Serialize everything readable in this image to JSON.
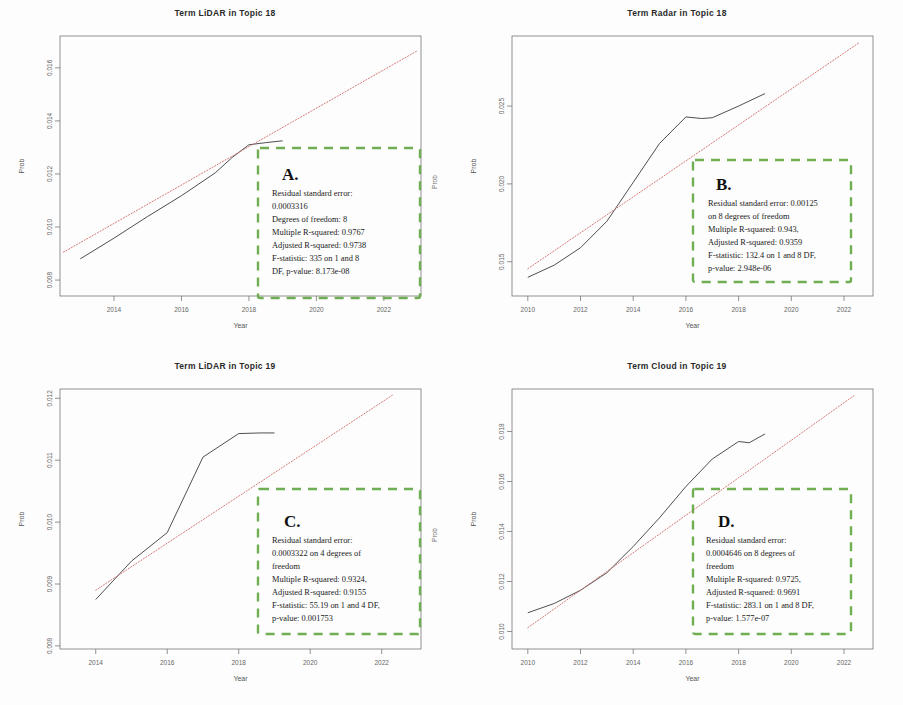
{
  "figure": {
    "panel_count": 4,
    "axis_label_x": "Year",
    "axis_label_y": "Prob",
    "annotation_box_color": "#6fae52",
    "fit_line_color": "#d06a6a",
    "data_line_color": "#3b3b3b"
  },
  "chart_data": [
    {
      "id": "A",
      "type": "line",
      "title": "Term LiDAR in Topic 18",
      "xlabel": "Year",
      "ylabel": "Prob",
      "xlim": [
        2012.4,
        2023.1
      ],
      "ylim": [
        0.0074,
        0.0172
      ],
      "xticks": [
        2014,
        2016,
        2018,
        2020,
        2022
      ],
      "yticks": [
        0.008,
        0.01,
        0.012,
        0.014,
        0.016
      ],
      "ytick_labels": [
        "0.008",
        "0.010",
        "0.012",
        "0.014",
        "0.016"
      ],
      "grid": false,
      "legend": "none",
      "series": [
        {
          "name": "observed",
          "style": "solid",
          "x": [
            2013,
            2014,
            2015,
            2016,
            2017,
            2017.5,
            2018,
            2018.5,
            2019
          ],
          "values": [
            0.0088,
            0.00958,
            0.0104,
            0.01118,
            0.01204,
            0.01262,
            0.0131,
            0.01318,
            0.01325
          ]
        },
        {
          "name": "linear fit",
          "style": "dotted",
          "x": [
            2012.5,
            2023.0
          ],
          "values": [
            0.00905,
            0.01665
          ]
        }
      ],
      "annotation": {
        "letter": "A.",
        "lines": [
          "Residual standard error:",
          "0.0003316",
          "Degrees of freedom: 8",
          "Multiple R-squared:  0.9767",
          "Adjusted R-squared:  0.9738",
          "F-statistic:    335  on 1  and 8",
          "DF, p-value: 8.173e-08"
        ]
      }
    },
    {
      "id": "B",
      "type": "line",
      "title": "Term Radar in Topic 18",
      "xlabel": "Year",
      "ylabel": "Prob",
      "xlim": [
        2009.4,
        2023.1
      ],
      "ylim": [
        0.0128,
        0.0295
      ],
      "xticks": [
        2010,
        2012,
        2014,
        2016,
        2018,
        2020,
        2022
      ],
      "yticks": [
        0.015,
        0.02,
        0.025
      ],
      "ytick_labels": [
        "0.015",
        "0.020",
        "0.025"
      ],
      "grid": false,
      "legend": "none",
      "series": [
        {
          "name": "observed",
          "style": "solid",
          "x": [
            2010,
            2011,
            2012,
            2013,
            2014,
            2015,
            2016,
            2016.6,
            2017,
            2018,
            2019
          ],
          "values": [
            0.014,
            0.01478,
            0.0159,
            0.0176,
            0.0201,
            0.0226,
            0.0243,
            0.0242,
            0.02425,
            0.025,
            0.0258
          ]
        },
        {
          "name": "linear fit",
          "style": "dotted",
          "x": [
            2010.0,
            2022.6
          ],
          "values": [
            0.01455,
            0.0291
          ]
        }
      ],
      "annotation": {
        "letter": "B.",
        "lines": [
          "Residual standard error: 0.00125",
          "on 8 degrees of freedom",
          "Multiple R-squared:  0.943,",
          "Adjusted R-squared:  0.9359",
          "F-statistic: 132.4 on 1 and 8 DF,",
          "p-value: 2.948e-06"
        ]
      }
    },
    {
      "id": "C",
      "type": "line",
      "title": "Term LiDAR in Topic 19",
      "xlabel": "Year",
      "ylabel": "Prob",
      "xlim": [
        2013.0,
        2023.1
      ],
      "ylim": [
        0.00795,
        0.01215
      ],
      "xticks": [
        2014,
        2016,
        2018,
        2020,
        2022
      ],
      "yticks": [
        0.008,
        0.009,
        0.01,
        0.011,
        0.012
      ],
      "ytick_labels": [
        "0.008",
        "0.009",
        "0.010",
        "0.011",
        "0.012"
      ],
      "grid": false,
      "legend": "none",
      "series": [
        {
          "name": "observed",
          "style": "solid",
          "x": [
            2014,
            2015,
            2016,
            2017,
            2018,
            2018.6,
            2019
          ],
          "values": [
            0.00875,
            0.00937,
            0.00983,
            0.01105,
            0.01143,
            0.01144,
            0.01144
          ]
        },
        {
          "name": "linear fit",
          "style": "dotted",
          "x": [
            2014.0,
            2022.3
          ],
          "values": [
            0.0089,
            0.01205
          ]
        }
      ],
      "annotation": {
        "letter": "C.",
        "lines": [
          "Residual standard error:",
          "0.0003322 on 4 degrees of",
          "freedom",
          "Multiple R-squared:  0.9324,",
          "Adjusted R-squared:  0.9155",
          "F-statistic: 55.19 on 1 and 4 DF,",
          "p-value: 0.001753"
        ]
      }
    },
    {
      "id": "D",
      "type": "line",
      "title": "Term Cloud in Topic 19",
      "xlabel": "Year",
      "ylabel": "Prob",
      "xlim": [
        2009.4,
        2023.1
      ],
      "ylim": [
        0.0093,
        0.0197
      ],
      "xticks": [
        2010,
        2012,
        2014,
        2016,
        2018,
        2020,
        2022
      ],
      "yticks": [
        0.01,
        0.012,
        0.014,
        0.016,
        0.018
      ],
      "ytick_labels": [
        "0.010",
        "0.012",
        "0.014",
        "0.016",
        "0.018"
      ],
      "grid": false,
      "legend": "none",
      "series": [
        {
          "name": "observed",
          "style": "solid",
          "x": [
            2010,
            2011,
            2012,
            2013,
            2014,
            2015,
            2016,
            2017,
            2018,
            2018.4,
            2019
          ],
          "values": [
            0.01075,
            0.01112,
            0.01165,
            0.01235,
            0.0134,
            0.01455,
            0.0158,
            0.0169,
            0.0176,
            0.01755,
            0.0179
          ]
        },
        {
          "name": "linear fit",
          "style": "dotted",
          "x": [
            2010.0,
            2022.4
          ],
          "values": [
            0.01015,
            0.01945
          ]
        }
      ],
      "annotation": {
        "letter": "D.",
        "lines": [
          "Residual standard error:",
          "0.0004646 on 8 degrees of",
          "freedom",
          "Multiple R-squared:  0.9725,",
          "Adjusted R-squared:  0.9691",
          "F-statistic: 283.1 on 1 and 8 DF,",
          "p-value: 1.577e-07"
        ]
      }
    }
  ]
}
